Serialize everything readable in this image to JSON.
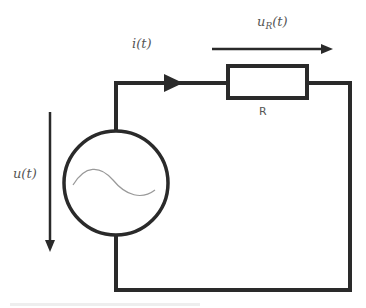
{
  "diagram": {
    "type": "circuit",
    "labels": {
      "current": "i(t)",
      "resistor_voltage_main": "u",
      "resistor_voltage_sub": "R",
      "resistor_voltage_suffix": "(t)",
      "resistor": "R",
      "source_voltage": "u(t)"
    },
    "components": [
      {
        "id": "source",
        "kind": "ac-voltage-source",
        "symbol": "sine-wave"
      },
      {
        "id": "resistor",
        "kind": "resistor",
        "label": "R"
      }
    ],
    "arrows": [
      {
        "name": "current-arrow",
        "label": "i(t)",
        "direction": "right"
      },
      {
        "name": "resistor-voltage-arrow",
        "label": "u_R(t)",
        "direction": "right"
      },
      {
        "name": "source-voltage-arrow",
        "label": "u(t)",
        "direction": "down"
      }
    ],
    "colors": {
      "wire": "#2a2a2a",
      "label": "#555555",
      "sine": "#999999",
      "background": "#ffffff"
    }
  }
}
